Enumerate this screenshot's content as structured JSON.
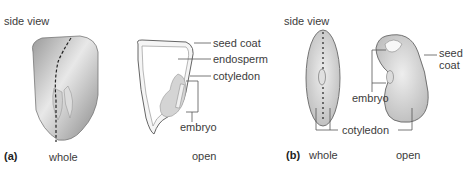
{
  "figure": {
    "panel_a": {
      "letter": "(a)",
      "side_view_label": "side view",
      "whole_label": "whole",
      "open_label": "open",
      "callouts": {
        "seed_coat": "seed coat",
        "endosperm": "endosperm",
        "cotyledon": "cotyledon",
        "embryo": "embryo"
      }
    },
    "panel_b": {
      "letter": "(b)",
      "side_view_label": "side view",
      "whole_label": "whole",
      "open_label": "open",
      "callouts": {
        "seed_coat_line1": "seed",
        "seed_coat_line2": "coat",
        "embryo": "embryo",
        "cotyledon": "cotyledon"
      }
    },
    "colors": {
      "outline": "#555555",
      "fill_light": "#e6e6e6",
      "fill_mid": "#cfcfcf",
      "leader": "#555555"
    }
  }
}
